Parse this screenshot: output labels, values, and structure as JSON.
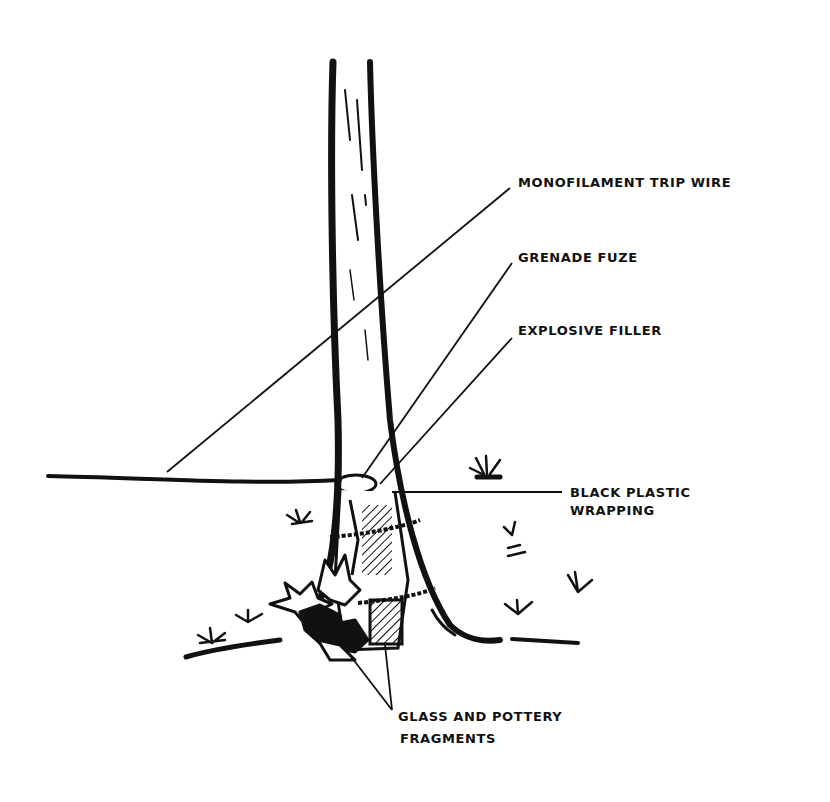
{
  "diagram": {
    "colors": {
      "ink": "#111111",
      "paper": "#ffffff"
    },
    "labels": {
      "trip_wire": "MONOFILAMENT TRIP WIRE",
      "fuze": "GRENADE FUZE",
      "filler": "EXPLOSIVE FILLER",
      "wrapping_line1": "BLACK PLASTIC",
      "wrapping_line2": "WRAPPING",
      "fragments_line1": "GLASS AND POTTERY",
      "fragments_line2": "FRAGMENTS"
    }
  }
}
